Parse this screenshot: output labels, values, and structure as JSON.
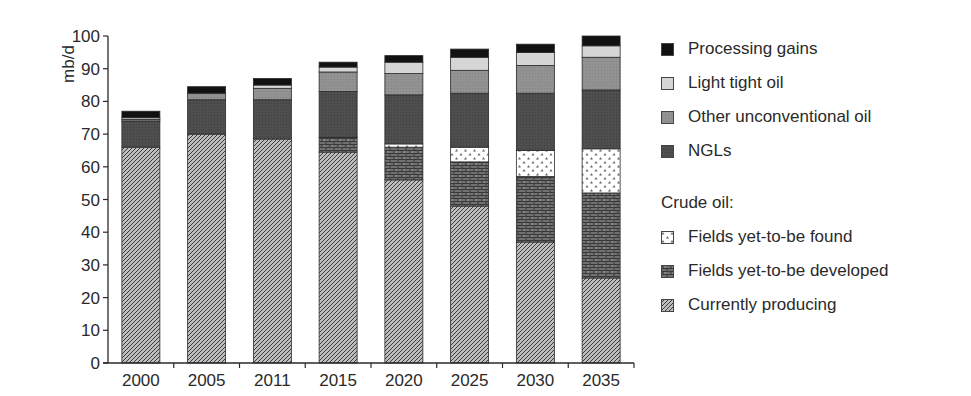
{
  "chart_data": {
    "type": "bar",
    "stacked": true,
    "title": "",
    "xlabel": "",
    "ylabel": "mb/d",
    "ylim": [
      0,
      100
    ],
    "yticks": [
      0,
      10,
      20,
      30,
      40,
      50,
      60,
      70,
      80,
      90,
      100
    ],
    "grid": false,
    "legend_position": "right",
    "categories": [
      "2000",
      "2005",
      "2011",
      "2015",
      "2020",
      "2025",
      "2030",
      "2035"
    ],
    "series": [
      {
        "name": "Currently producing",
        "group": "Crude oil",
        "pattern": "diagonal-hatch",
        "values": [
          66,
          70,
          68.5,
          64.5,
          56,
          48,
          37,
          26
        ]
      },
      {
        "name": "Fields yet-to-be developed",
        "group": "Crude oil",
        "pattern": "brick",
        "values": [
          0,
          0,
          0,
          4.5,
          10,
          13.5,
          20,
          26
        ]
      },
      {
        "name": "Fields yet-to-be found",
        "group": "Crude oil",
        "pattern": "dotted-white",
        "values": [
          0,
          0,
          0,
          0,
          1,
          4.5,
          8,
          13.5
        ]
      },
      {
        "name": "NGLs",
        "pattern": "dark-gray",
        "values": [
          8,
          10.5,
          12,
          14,
          15,
          16.5,
          17.5,
          18
        ]
      },
      {
        "name": "Other unconventional oil",
        "pattern": "medium-gray",
        "values": [
          0.5,
          2,
          3.5,
          6,
          6.5,
          7,
          8.5,
          10
        ]
      },
      {
        "name": "Light tight oil",
        "pattern": "light-gray",
        "values": [
          0.5,
          0,
          1,
          1.5,
          3.5,
          4,
          4,
          3.5
        ]
      },
      {
        "name": "Processing gains",
        "pattern": "black",
        "values": [
          2,
          2,
          2,
          1.5,
          2,
          2.5,
          2.5,
          3
        ]
      }
    ],
    "totals": [
      77,
      84.5,
      87,
      92,
      94,
      96,
      98,
      100
    ]
  },
  "axis": {
    "y_label": "mb/d",
    "y_ticks": [
      "0",
      "10",
      "20",
      "30",
      "40",
      "50",
      "60",
      "70",
      "80",
      "90",
      "100"
    ],
    "x_ticks": [
      "2000",
      "2005",
      "2011",
      "2015",
      "2020",
      "2025",
      "2030",
      "2035"
    ]
  },
  "legend": {
    "items": [
      {
        "label": "Processing gains",
        "pattern": "black"
      },
      {
        "label": "Light tight oil",
        "pattern": "light-gray"
      },
      {
        "label": "Other unconventional oil",
        "pattern": "medium-gray"
      },
      {
        "label": "NGLs",
        "pattern": "dark-gray"
      }
    ],
    "group_heading": "Crude oil:",
    "group_items": [
      {
        "label": "Fields yet-to-be found",
        "pattern": "dotted-white"
      },
      {
        "label": "Fields yet-to-be developed",
        "pattern": "brick"
      },
      {
        "label": "Currently producing",
        "pattern": "diagonal-hatch"
      }
    ]
  },
  "colors": {
    "black": "#111111",
    "light-gray": "#d4d4d4",
    "medium-gray": "#8e8e8e",
    "dark-gray": "#4a4a4a",
    "axis": "#2a2a2a"
  }
}
